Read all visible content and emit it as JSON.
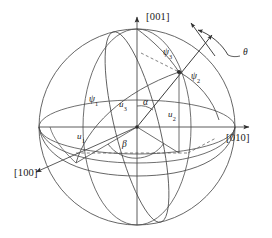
{
  "figure": {
    "type": "stereographic-sphere-diagram",
    "background_color": "#ffffff",
    "line_color": "#3a3a3a",
    "text_color": "#1a1a1a"
  },
  "axes": [
    {
      "id": "axis-001",
      "label": "[001]",
      "direction": "up",
      "arrow": true
    },
    {
      "id": "axis-010",
      "label": "[010]",
      "direction": "right",
      "arrow": true
    },
    {
      "id": "axis-100",
      "label": "[100]",
      "direction": "lower-left",
      "arrow": true
    }
  ],
  "components": [
    {
      "id": "u1",
      "base": "u",
      "subscript": "1",
      "label": "u1",
      "description": "projection component along [100]"
    },
    {
      "id": "u2",
      "base": "u",
      "subscript": "2",
      "label": "u2",
      "description": "projection component along [010]"
    },
    {
      "id": "u3",
      "base": "u",
      "subscript": "3",
      "label": "u3",
      "description": "projection component along [001]"
    }
  ],
  "angles": [
    {
      "id": "alpha",
      "symbol": "α",
      "label": "α",
      "description": "angle between u3 axis and the direction vector"
    },
    {
      "id": "beta",
      "symbol": "β",
      "label": "β",
      "description": "azimuthal angle in the equatorial plane"
    },
    {
      "id": "theta",
      "symbol": "θ",
      "label": "θ",
      "description": "rotation angle about the direction vector"
    }
  ],
  "spherical_angles": [
    {
      "id": "psi1",
      "base": "ψ",
      "subscript": "1",
      "label": "ψ1",
      "description": "arc angle from [100] pole"
    },
    {
      "id": "psi2",
      "base": "ψ",
      "subscript": "2",
      "label": "ψ2",
      "description": "arc angle from [010] pole"
    },
    {
      "id": "psi3",
      "base": "ψ",
      "subscript": "3",
      "label": "ψ3",
      "description": "arc angle from [001] pole"
    }
  ],
  "markers": {
    "origin": "sphere-center",
    "pole_point": "direction-vector-intersection"
  }
}
